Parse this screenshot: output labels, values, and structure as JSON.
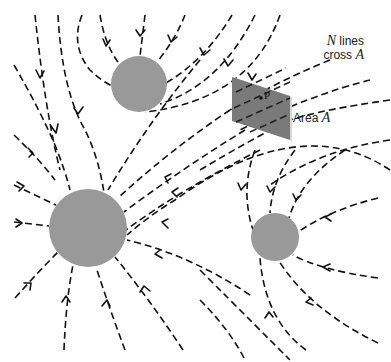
{
  "figure": {
    "type": "electric field line diagram",
    "charges": [
      {
        "id": "top",
        "cx": 139,
        "cy": 84,
        "r": 28,
        "color": "#999999"
      },
      {
        "id": "large-left",
        "cx": 88,
        "cy": 228,
        "r": 39,
        "color": "#999999"
      },
      {
        "id": "right",
        "cx": 275,
        "cy": 237,
        "r": 24,
        "color": "#999999"
      }
    ],
    "area_plate": {
      "color": "#7a7a7a",
      "edge_color": "#d8d8d8"
    },
    "point_label": "P",
    "lines_label": {
      "prefix_symbol": "N",
      "line1_rest": " lines",
      "line2_text": "cross ",
      "line2_symbol": "A"
    },
    "area_label": {
      "text": "Area ",
      "symbol": "A"
    },
    "line_style": "dashed",
    "arrow_direction": "toward charges"
  }
}
